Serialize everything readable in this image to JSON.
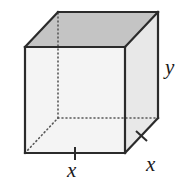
{
  "figure": {
    "name": "rectangular-prism-dimension-diagram",
    "background_color": "#ffffff"
  },
  "geometry": {
    "projection": "oblique",
    "front_face": {
      "top_left": [
        25,
        47
      ],
      "top_right": [
        125,
        47
      ],
      "bottom_right": [
        125,
        153
      ],
      "bottom_left": [
        25,
        153
      ]
    },
    "depth_offset": [
      33,
      -35
    ],
    "back_face": {
      "top_left": [
        58,
        12
      ],
      "top_right": [
        158,
        12
      ],
      "bottom_right": [
        158,
        118
      ],
      "bottom_left": [
        58,
        118
      ]
    },
    "hidden_vertex": [
      58,
      118
    ]
  },
  "faces": {
    "top": {
      "name": "top-face",
      "fill": "#c4c4c4",
      "points": "25,47 58,12 158,12 125,47"
    },
    "front": {
      "name": "front-face",
      "fill": "#f2f2f2",
      "points": "25,47 125,47 125,153 25,153"
    },
    "right": {
      "name": "right-face",
      "fill": "#e8e8e8",
      "points": "125,47 158,12 158,118 125,153"
    }
  },
  "edges": {
    "stroke_color": "#2b2b2b",
    "stroke_width": 2.2,
    "hidden_stroke_color": "#555555",
    "hidden_stroke_width": 1.6,
    "hidden_dash": "1,3",
    "visible": [
      "front-top",
      "front-right",
      "front-bottom",
      "front-left",
      "back-top",
      "back-right",
      "top-left-diagonal",
      "top-right-diagonal",
      "bottom-right-diagonal"
    ],
    "hidden": [
      "back-left-vertical",
      "back-bottom-horizontal",
      "back-bottom-left-diagonal"
    ]
  },
  "ticks": {
    "stroke_color": "#2b2b2b",
    "stroke_width": 2,
    "items": [
      {
        "name": "tick-bottom-edge",
        "x1": 75,
        "y1": 147,
        "x2": 75,
        "y2": 160
      },
      {
        "name": "tick-right-diagonal",
        "x1": 137,
        "y1": 131,
        "x2": 147,
        "y2": 140
      }
    ]
  },
  "labels": {
    "x_bottom": {
      "name": "label-x-bottom",
      "text": "x",
      "meaning": "width of the front bottom edge",
      "x": 75,
      "y": 170
    },
    "x_right": {
      "name": "label-x-right",
      "text": "x",
      "meaning": "depth along the bottom right diagonal edge",
      "x": 152,
      "y": 164
    },
    "y_right": {
      "name": "label-y-right",
      "text": "y",
      "meaning": "height of the right vertical edge",
      "x": 172,
      "y": 67
    }
  }
}
